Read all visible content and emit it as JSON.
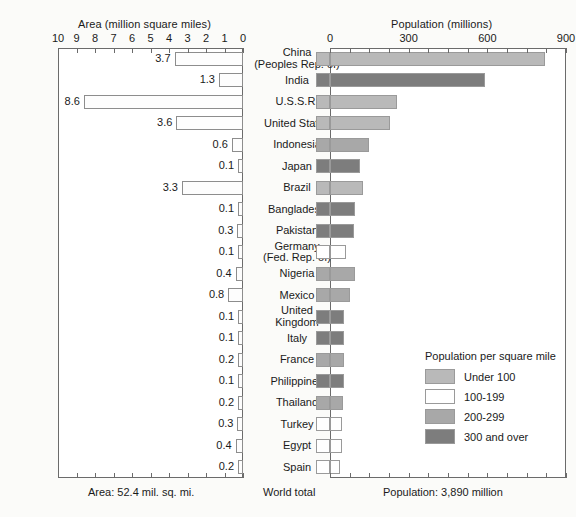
{
  "chart_data": {
    "type": "bar",
    "title": "",
    "orientation": "horizontal-diverging",
    "left_panel": {
      "axis_title": "Area (million square miles)",
      "ticks": [
        10,
        9,
        8,
        7,
        6,
        5,
        4,
        3,
        2,
        1,
        0
      ],
      "tick_labels": [
        "10",
        "9",
        "8",
        "7",
        "6",
        "5",
        "4",
        "3",
        "2",
        "1",
        "0"
      ],
      "axis_range": [
        10,
        0
      ],
      "direction": "right-to-left",
      "units": "million square miles",
      "footer": "Area: 52.4 mil. sq. mi."
    },
    "right_panel": {
      "axis_title": "Population (millions)",
      "ticks": [
        0,
        300,
        600,
        900
      ],
      "tick_labels": [
        "0",
        "300",
        "600",
        "900"
      ],
      "minor_tick_step": 75,
      "axis_range": [
        0,
        900
      ],
      "direction": "left-to-right",
      "units": "millions",
      "footer": "Population: 3,890 million"
    },
    "center_footer": "World total",
    "grid": false,
    "legend": {
      "position": "inside-right-lower",
      "title": "Population per square mile",
      "entries": [
        {
          "label": "Under 100",
          "color": "#b9b9b9"
        },
        {
          "label": "100-199",
          "color": "#ffffff"
        },
        {
          "label": "200-299",
          "color": "#a8a8a8"
        },
        {
          "label": "300 and over",
          "color": "#7d7d7d"
        }
      ]
    },
    "categories": [
      "China\n(Peoples Rep. of)",
      "India",
      "U.S.S.R.",
      "United States",
      "Indonesia",
      "Japan",
      "Brazil",
      "Bangladesh",
      "Pakistan",
      "Germany\n(Fed. Rep. of)",
      "Nigeria",
      "Mexico",
      "United\nKingdom",
      "Italy",
      "France",
      "Philippines",
      "Thailand",
      "Turkey",
      "Egypt",
      "Spain"
    ],
    "series": [
      {
        "name": "Area (million square miles)",
        "axis": "left",
        "values": [
          3.7,
          1.3,
          8.6,
          3.6,
          0.6,
          0.1,
          3.3,
          0.1,
          0.3,
          0.1,
          0.4,
          0.8,
          0.1,
          0.1,
          0.2,
          0.1,
          0.2,
          0.3,
          0.4,
          0.2
        ],
        "labels": [
          "3.7",
          "1.3",
          "8.6",
          "3.6",
          "0.6",
          "0.1",
          "3.3",
          "0.1",
          "0.3",
          "0.1",
          "0.4",
          "0.8",
          "0.1",
          "0.1",
          "0.2",
          "0.1",
          "0.2",
          "0.3",
          "0.4",
          "0.2"
        ]
      },
      {
        "name": "Population (millions)",
        "axis": "right",
        "values": [
          820,
          590,
          255,
          230,
          150,
          115,
          125,
          95,
          90,
          60,
          95,
          75,
          55,
          55,
          55,
          55,
          50,
          45,
          45,
          38
        ],
        "density_class": [
          0,
          3,
          0,
          0,
          2,
          3,
          0,
          3,
          3,
          1,
          2,
          2,
          3,
          3,
          2,
          3,
          2,
          1,
          1,
          1
        ]
      }
    ]
  },
  "footer": {
    "left": "Area: 52.4 mil. sq. mi.",
    "center": "World total",
    "right": "Population: 3,890 million"
  }
}
